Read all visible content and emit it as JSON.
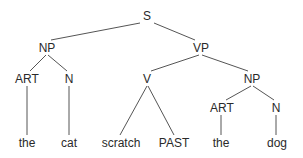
{
  "diagram": {
    "type": "syntax-tree",
    "nodes": {
      "s": {
        "label": "S",
        "x": 147,
        "y": 16
      },
      "np_subj": {
        "label": "NP",
        "x": 47,
        "y": 48
      },
      "vp": {
        "label": "VP",
        "x": 201,
        "y": 48
      },
      "art_subj": {
        "label": "ART",
        "x": 27,
        "y": 79
      },
      "n_subj": {
        "label": "N",
        "x": 69,
        "y": 79
      },
      "v": {
        "label": "V",
        "x": 147,
        "y": 79
      },
      "np_obj": {
        "label": "NP",
        "x": 252,
        "y": 79
      },
      "art_obj": {
        "label": "ART",
        "x": 222,
        "y": 108
      },
      "n_obj": {
        "label": "N",
        "x": 276,
        "y": 108
      },
      "leaf_the_1": {
        "label": "the",
        "x": 27,
        "y": 143
      },
      "leaf_cat": {
        "label": "cat",
        "x": 69,
        "y": 143
      },
      "leaf_scratch": {
        "label": "scratch",
        "x": 121,
        "y": 143
      },
      "leaf_past": {
        "label": "PAST",
        "x": 174,
        "y": 143
      },
      "leaf_the_2": {
        "label": "the",
        "x": 221,
        "y": 143
      },
      "leaf_dog": {
        "label": "dog",
        "x": 277,
        "y": 143
      }
    },
    "edges": [
      {
        "from": "s",
        "to": "np_subj",
        "x1": 140,
        "y1": 23,
        "x2": 51,
        "y2": 40
      },
      {
        "from": "s",
        "to": "vp",
        "x1": 154,
        "y1": 23,
        "x2": 195,
        "y2": 40
      },
      {
        "from": "np_subj",
        "to": "art_subj",
        "x1": 46,
        "y1": 55,
        "x2": 30,
        "y2": 71
      },
      {
        "from": "np_subj",
        "to": "n_subj",
        "x1": 48,
        "y1": 55,
        "x2": 67,
        "y2": 71
      },
      {
        "from": "vp",
        "to": "v",
        "x1": 199,
        "y1": 55,
        "x2": 151,
        "y2": 71
      },
      {
        "from": "vp",
        "to": "np_obj",
        "x1": 202,
        "y1": 55,
        "x2": 248,
        "y2": 71
      },
      {
        "from": "v",
        "to": "leaf_scratch",
        "x1": 147,
        "y1": 86,
        "x2": 120,
        "y2": 135
      },
      {
        "from": "v",
        "to": "leaf_past",
        "x1": 148,
        "y1": 86,
        "x2": 174,
        "y2": 135
      },
      {
        "from": "np_obj",
        "to": "art_obj",
        "x1": 251,
        "y1": 86,
        "x2": 226,
        "y2": 100
      },
      {
        "from": "np_obj",
        "to": "n_obj",
        "x1": 253,
        "y1": 86,
        "x2": 274,
        "y2": 100
      },
      {
        "from": "art_subj",
        "to": "leaf_the_1",
        "x1": 27,
        "y1": 86,
        "x2": 27,
        "y2": 135
      },
      {
        "from": "n_subj",
        "to": "leaf_cat",
        "x1": 69,
        "y1": 86,
        "x2": 69,
        "y2": 135
      },
      {
        "from": "art_obj",
        "to": "leaf_the_2",
        "x1": 221,
        "y1": 115,
        "x2": 221,
        "y2": 135
      },
      {
        "from": "n_obj",
        "to": "leaf_dog",
        "x1": 276,
        "y1": 115,
        "x2": 276,
        "y2": 135
      }
    ]
  }
}
